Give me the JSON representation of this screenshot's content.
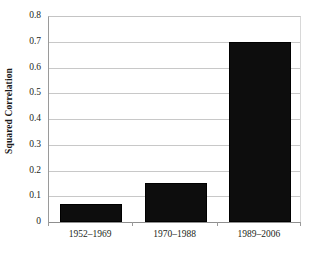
{
  "chart_data": {
    "type": "bar",
    "title": "",
    "subtitle": "",
    "xlabel": "",
    "ylabel": "Squared Correlation",
    "categories": [
      "1952–1969",
      "1970–1988",
      "1989–2006"
    ],
    "values": [
      0.07,
      0.15,
      0.7
    ],
    "series": [
      {
        "name": "Squared Correlation",
        "values": [
          0.07,
          0.15,
          0.7
        ]
      }
    ],
    "ylim": [
      0,
      0.8
    ],
    "xlim": [
      0,
      3
    ],
    "y_ticks": [
      0,
      0.1,
      0.2,
      0.3,
      0.4,
      0.5,
      0.6,
      0.7,
      0.8
    ],
    "y_tick_labels": [
      "0",
      "0.1",
      "0.2",
      "0.3",
      "0.4",
      "0.5",
      "0.6",
      "0.7",
      "0.8"
    ],
    "x_tick_labels": [
      "1952–1969",
      "1970–1988",
      "1989–2006"
    ],
    "grid": {
      "horizontal": true,
      "vertical": false
    },
    "legend": {
      "visible": false,
      "position": "none",
      "entries": []
    },
    "annotations": [],
    "colors": {
      "bar_fill": "#0d0d0d",
      "bar_edge": "#000000",
      "gridline": "#c8c8c8",
      "axis_line": "#8f8f8f",
      "plot_background": "#ffffff",
      "text": "#231f20"
    }
  }
}
